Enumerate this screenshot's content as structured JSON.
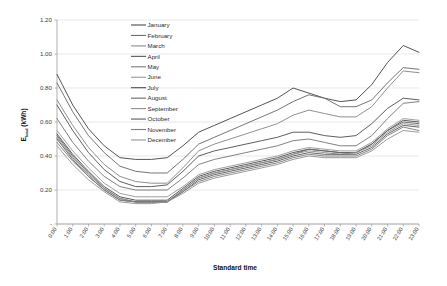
{
  "chart_data": {
    "type": "line",
    "title": "",
    "xlabel": "Standard time",
    "ylabel": "E_load (kWh)",
    "ylabel_main": "E",
    "ylabel_sub": "load",
    "ylabel_unit": " (kWh)",
    "ylim": [
      0,
      1.2
    ],
    "yticks": [
      0,
      0.2,
      0.4,
      0.6,
      0.8,
      1.0,
      1.2
    ],
    "ytick_labels": [
      "-",
      "0.20",
      "0.40",
      "0.60",
      "0.80",
      "1.00",
      "1.20"
    ],
    "grid": true,
    "legend_position": "inside-top-left",
    "categories": [
      "0:00",
      "1:00",
      "2:00",
      "3:00",
      "4:00",
      "5:00",
      "6:00",
      "7:00",
      "8:00",
      "9:00",
      "10:00",
      "11:00",
      "12:00",
      "13:00",
      "14:00",
      "15:00",
      "16:00",
      "17:00",
      "18:00",
      "19:00",
      "20:00",
      "21:00",
      "22:00",
      "23:00"
    ],
    "series": [
      {
        "name": "January",
        "color": "#4a4a4a",
        "values": [
          0.88,
          0.7,
          0.56,
          0.46,
          0.39,
          0.38,
          0.38,
          0.39,
          0.46,
          0.54,
          0.58,
          0.62,
          0.66,
          0.7,
          0.74,
          0.8,
          0.77,
          0.74,
          0.72,
          0.73,
          0.82,
          0.95,
          1.05,
          1.01
        ]
      },
      {
        "name": "February",
        "color": "#6e6e6e",
        "values": [
          0.83,
          0.66,
          0.52,
          0.42,
          0.34,
          0.31,
          0.3,
          0.3,
          0.38,
          0.47,
          0.51,
          0.55,
          0.59,
          0.63,
          0.67,
          0.72,
          0.76,
          0.74,
          0.69,
          0.69,
          0.73,
          0.83,
          0.92,
          0.91
        ]
      },
      {
        "name": "March",
        "color": "#8a8a8a",
        "values": [
          0.73,
          0.58,
          0.45,
          0.35,
          0.28,
          0.25,
          0.24,
          0.24,
          0.33,
          0.43,
          0.47,
          0.5,
          0.53,
          0.56,
          0.59,
          0.64,
          0.67,
          0.65,
          0.63,
          0.63,
          0.69,
          0.8,
          0.9,
          0.89
        ]
      },
      {
        "name": "April",
        "color": "#555555",
        "values": [
          0.7,
          0.55,
          0.42,
          0.32,
          0.25,
          0.22,
          0.22,
          0.23,
          0.31,
          0.4,
          0.43,
          0.45,
          0.47,
          0.49,
          0.51,
          0.54,
          0.54,
          0.52,
          0.51,
          0.52,
          0.59,
          0.68,
          0.74,
          0.73
        ]
      },
      {
        "name": "May",
        "color": "#7a7a7a",
        "values": [
          0.62,
          0.48,
          0.37,
          0.28,
          0.22,
          0.2,
          0.2,
          0.2,
          0.27,
          0.35,
          0.38,
          0.4,
          0.42,
          0.44,
          0.46,
          0.49,
          0.5,
          0.48,
          0.46,
          0.46,
          0.52,
          0.62,
          0.71,
          0.72
        ]
      },
      {
        "name": "June",
        "color": "#9a9a9a",
        "values": [
          0.55,
          0.43,
          0.33,
          0.24,
          0.18,
          0.16,
          0.16,
          0.16,
          0.22,
          0.29,
          0.32,
          0.34,
          0.36,
          0.38,
          0.4,
          0.43,
          0.45,
          0.44,
          0.43,
          0.43,
          0.48,
          0.56,
          0.62,
          0.61
        ]
      },
      {
        "name": "July",
        "color": "#4f4f4f",
        "values": [
          0.53,
          0.41,
          0.31,
          0.22,
          0.16,
          0.14,
          0.14,
          0.14,
          0.21,
          0.28,
          0.31,
          0.33,
          0.35,
          0.37,
          0.39,
          0.42,
          0.44,
          0.43,
          0.42,
          0.42,
          0.47,
          0.55,
          0.61,
          0.6
        ]
      },
      {
        "name": "August",
        "color": "#666666",
        "values": [
          0.52,
          0.4,
          0.3,
          0.21,
          0.15,
          0.13,
          0.13,
          0.13,
          0.2,
          0.27,
          0.3,
          0.32,
          0.34,
          0.36,
          0.38,
          0.41,
          0.44,
          0.43,
          0.42,
          0.42,
          0.47,
          0.55,
          0.6,
          0.59
        ]
      },
      {
        "name": "September",
        "color": "#8f8f8f",
        "values": [
          0.51,
          0.39,
          0.29,
          0.21,
          0.15,
          0.13,
          0.13,
          0.13,
          0.2,
          0.27,
          0.3,
          0.32,
          0.34,
          0.36,
          0.38,
          0.41,
          0.43,
          0.42,
          0.41,
          0.42,
          0.46,
          0.54,
          0.59,
          0.58
        ]
      },
      {
        "name": "October",
        "color": "#5c5c5c",
        "values": [
          0.5,
          0.38,
          0.28,
          0.2,
          0.14,
          0.13,
          0.13,
          0.13,
          0.19,
          0.26,
          0.29,
          0.31,
          0.33,
          0.35,
          0.37,
          0.4,
          0.42,
          0.41,
          0.41,
          0.41,
          0.45,
          0.53,
          0.58,
          0.57
        ]
      },
      {
        "name": "November",
        "color": "#7f7f7f",
        "values": [
          0.48,
          0.37,
          0.28,
          0.2,
          0.14,
          0.13,
          0.13,
          0.13,
          0.19,
          0.25,
          0.28,
          0.3,
          0.32,
          0.34,
          0.36,
          0.39,
          0.41,
          0.4,
          0.4,
          0.4,
          0.44,
          0.52,
          0.57,
          0.55
        ]
      },
      {
        "name": "December",
        "color": "#959595",
        "values": [
          0.46,
          0.35,
          0.26,
          0.19,
          0.13,
          0.12,
          0.12,
          0.13,
          0.18,
          0.24,
          0.27,
          0.29,
          0.31,
          0.33,
          0.35,
          0.38,
          0.4,
          0.39,
          0.39,
          0.39,
          0.43,
          0.5,
          0.55,
          0.54
        ]
      }
    ]
  }
}
